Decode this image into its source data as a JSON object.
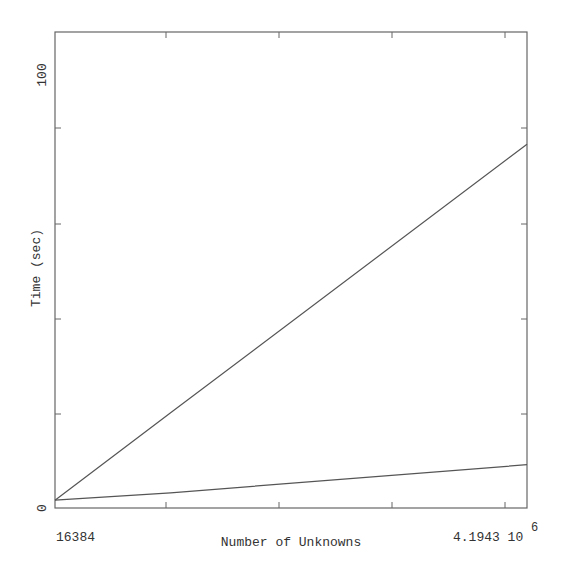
{
  "chart_data": {
    "type": "line",
    "title": "",
    "xlabel": "Number of Unknowns",
    "ylabel": "Time (sec)",
    "xlim": [
      16384,
      4194304
    ],
    "ylim": [
      0,
      110
    ],
    "x_tick_labels": {
      "left": "16384",
      "right": "4.1943",
      "right_exponent_base": "10",
      "right_exponent": "6"
    },
    "y_tick_labels": [
      "0",
      "100"
    ],
    "grid": false,
    "legend": null,
    "x": [
      16384,
      1040000,
      4194304
    ],
    "series": [
      {
        "name": "upper",
        "values": [
          1.8,
          22.0,
          84.0
        ]
      },
      {
        "name": "lower",
        "values": [
          1.8,
          3.5,
          10.0
        ]
      }
    ]
  },
  "axes": {
    "x_title": "Number of Unknowns",
    "y_title": "Time (sec)",
    "x_left_label": "16384",
    "x_right_label": "4.1943 10",
    "x_right_exponent": "6",
    "y_zero_label": "0",
    "y_top_label": "100"
  },
  "colors": {
    "line": "#555555",
    "axis": "#555555",
    "text": "#333333",
    "background": "#ffffff"
  }
}
